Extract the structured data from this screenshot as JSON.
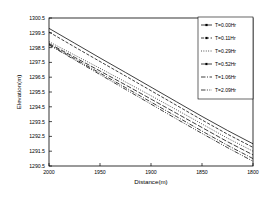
{
  "chart_data": {
    "type": "line",
    "title": "",
    "xlabel": "Distance(m)",
    "ylabel": "Elevation(m)",
    "xlim": [
      2000,
      1800
    ],
    "ylim": [
      1290.5,
      1300.5
    ],
    "x_ticks": [
      2000,
      1950,
      1900,
      1850,
      1800
    ],
    "x_tick_labels": [
      "2000",
      "1950",
      "1900",
      "1850",
      "1800"
    ],
    "y_ticks": [
      1290.5,
      1291.5,
      1292.5,
      1293.5,
      1294.5,
      1295.5,
      1296.5,
      1297.5,
      1298.5,
      1299.5,
      1300.5
    ],
    "y_tick_labels": [
      "1290.5",
      "1291.5",
      "1292.5",
      "1293.5",
      "1294.5",
      "1295.5",
      "1296.5",
      "1297.5",
      "1298.5",
      "1299.5",
      "1300.5"
    ],
    "x_axis_reversed": true,
    "grid": false,
    "legend_position": "upper-right",
    "x": [
      2000,
      1975,
      1950,
      1925,
      1900,
      1875,
      1850,
      1825,
      1800
    ],
    "series": [
      {
        "name": "T=0.00Hr",
        "dash": "none",
        "values": [
          1299.8,
          1298.8,
          1297.8,
          1296.82,
          1295.83,
          1294.84,
          1293.85,
          1292.9,
          1292.0
        ]
      },
      {
        "name": "T=0.11Hr",
        "dash": "dashed",
        "values": [
          1299.55,
          1298.55,
          1297.56,
          1296.58,
          1295.59,
          1294.6,
          1293.61,
          1292.65,
          1291.76
        ]
      },
      {
        "name": "T=0.29Hr",
        "dash": "dotted",
        "values": [
          1298.9,
          1298.0,
          1297.1,
          1296.18,
          1295.25,
          1294.3,
          1293.34,
          1292.38,
          1291.5
        ]
      },
      {
        "name": "T=0.52Hr",
        "dash": "long-dash",
        "values": [
          1298.78,
          1297.85,
          1296.92,
          1295.98,
          1295.02,
          1294.06,
          1293.1,
          1292.14,
          1291.25
        ]
      },
      {
        "name": "T=1.06Hr",
        "dash": "dash-dot",
        "values": [
          1298.72,
          1297.75,
          1296.78,
          1295.8,
          1294.82,
          1293.84,
          1292.86,
          1291.9,
          1291.0
        ]
      },
      {
        "name": "T=2.09Hr",
        "dash": "dash-dot-dot",
        "values": [
          1298.68,
          1297.68,
          1296.68,
          1295.68,
          1294.68,
          1293.68,
          1292.7,
          1291.74,
          1290.82
        ]
      }
    ]
  },
  "legend": {
    "entries": [
      {
        "label": "T=0.00Hr"
      },
      {
        "label": "T=0.11Hr"
      },
      {
        "label": "T=0.29Hr"
      },
      {
        "label": "T=0.52Hr"
      },
      {
        "label": "T=1.06Hr"
      },
      {
        "label": "T=2.09Hr"
      }
    ]
  },
  "colors": {
    "line": "#000000",
    "axis": "#000000",
    "background": "#ffffff"
  }
}
